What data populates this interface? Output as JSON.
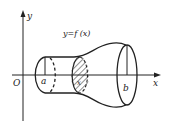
{
  "figure": {
    "curve_label": "y=f (x)",
    "axes": {
      "x_label": "x",
      "y_label": "y",
      "origin_label": "O"
    },
    "bounds": {
      "left_label": "a",
      "right_label": "b",
      "section_label": "x"
    },
    "colors": {
      "stroke": "#222222",
      "background": "#ffffff"
    }
  }
}
